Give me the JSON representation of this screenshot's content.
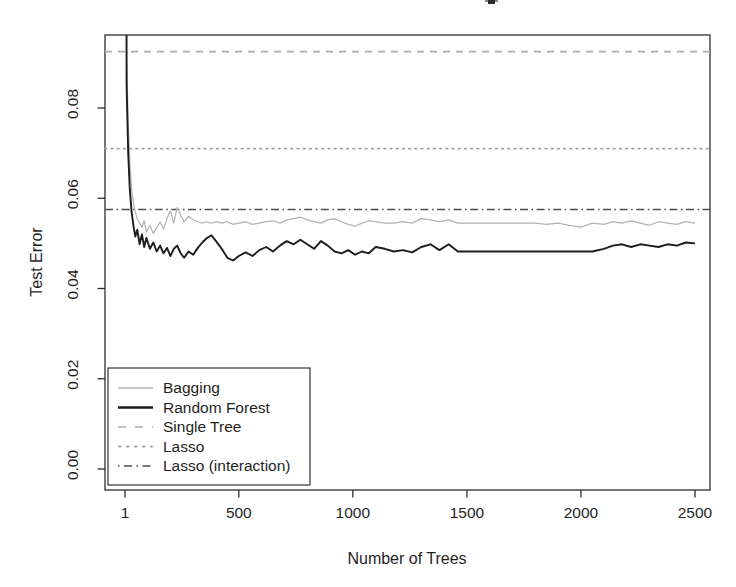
{
  "figure": {
    "background_color": "#ffffff",
    "note": "title cropped off at top edge; only a partial glyph remnant visible"
  },
  "chart_data": {
    "type": "line",
    "title": "",
    "xlabel": "Number of Trees",
    "ylabel": "Test Error",
    "xlim": [
      -87,
      2566
    ],
    "ylim": [
      -0.0046,
      0.0962
    ],
    "grid": false,
    "legend_position": "bottom-left",
    "x_ticks": [
      {
        "value": 1,
        "label": "1"
      },
      {
        "value": 500,
        "label": "500"
      },
      {
        "value": 1000,
        "label": "1000"
      },
      {
        "value": 1500,
        "label": "1500"
      },
      {
        "value": 2000,
        "label": "2000"
      },
      {
        "value": 2500,
        "label": "2500"
      }
    ],
    "y_ticks": [
      {
        "value": 0.0,
        "label": "0.00"
      },
      {
        "value": 0.02,
        "label": "0.02"
      },
      {
        "value": 0.04,
        "label": "0.04"
      },
      {
        "value": 0.06,
        "label": "0.06"
      },
      {
        "value": 0.08,
        "label": "0.08"
      }
    ],
    "x": [
      1,
      8,
      15,
      22,
      30,
      38,
      46,
      55,
      65,
      75,
      85,
      95,
      110,
      125,
      140,
      155,
      170,
      185,
      200,
      215,
      230,
      245,
      260,
      280,
      300,
      320,
      340,
      360,
      380,
      400,
      425,
      450,
      475,
      500,
      530,
      560,
      590,
      620,
      650,
      680,
      710,
      740,
      770,
      800,
      830,
      860,
      890,
      920,
      950,
      980,
      1010,
      1040,
      1070,
      1100,
      1140,
      1180,
      1220,
      1260,
      1300,
      1340,
      1380,
      1420,
      1460,
      1500,
      1550,
      1600,
      1650,
      1700,
      1750,
      1800,
      1850,
      1900,
      1950,
      2000,
      2050,
      2100,
      2140,
      2180,
      2220,
      2260,
      2300,
      2340,
      2380,
      2420,
      2460,
      2500
    ],
    "series": [
      {
        "name": "Bagging",
        "style": "solid-thin",
        "color": "#b2b2b2",
        "values": [
          0.3,
          0.092,
          0.077,
          0.068,
          0.062,
          0.059,
          0.057,
          0.0555,
          0.0545,
          0.0535,
          0.055,
          0.0525,
          0.054,
          0.0522,
          0.0535,
          0.0548,
          0.0532,
          0.0555,
          0.0572,
          0.0545,
          0.058,
          0.0562,
          0.0548,
          0.056,
          0.0552,
          0.0548,
          0.0545,
          0.0548,
          0.0545,
          0.0548,
          0.0545,
          0.0548,
          0.0542,
          0.0545,
          0.0548,
          0.0542,
          0.0545,
          0.0548,
          0.055,
          0.0545,
          0.0552,
          0.0555,
          0.0558,
          0.0552,
          0.0548,
          0.0545,
          0.0552,
          0.0555,
          0.0548,
          0.0542,
          0.0538,
          0.0545,
          0.055,
          0.0548,
          0.0545,
          0.0545,
          0.0548,
          0.0545,
          0.0555,
          0.0552,
          0.0548,
          0.0552,
          0.0545,
          0.0545,
          0.0545,
          0.0545,
          0.0545,
          0.0545,
          0.0545,
          0.0545,
          0.0542,
          0.0545,
          0.054,
          0.0536,
          0.0545,
          0.0542,
          0.0548,
          0.0545,
          0.055,
          0.0545,
          0.054,
          0.0548,
          0.0545,
          0.0542,
          0.0548,
          0.0545
        ]
      },
      {
        "name": "Random Forest",
        "style": "solid-thick",
        "color": "#1c1c1c",
        "values": [
          0.3,
          0.085,
          0.07,
          0.062,
          0.057,
          0.054,
          0.0515,
          0.053,
          0.0498,
          0.052,
          0.0492,
          0.0512,
          0.0488,
          0.0502,
          0.0482,
          0.0495,
          0.0478,
          0.049,
          0.0472,
          0.0488,
          0.0495,
          0.0478,
          0.0468,
          0.0482,
          0.0475,
          0.049,
          0.0502,
          0.0512,
          0.0518,
          0.0505,
          0.0488,
          0.0468,
          0.0462,
          0.0472,
          0.048,
          0.0472,
          0.0485,
          0.0492,
          0.0482,
          0.0495,
          0.0505,
          0.0498,
          0.0508,
          0.0498,
          0.0488,
          0.0505,
          0.0495,
          0.0482,
          0.0478,
          0.0485,
          0.0475,
          0.0482,
          0.0478,
          0.0492,
          0.0488,
          0.0482,
          0.0485,
          0.048,
          0.0492,
          0.0498,
          0.0485,
          0.0498,
          0.0482,
          0.0482,
          0.0482,
          0.0482,
          0.0482,
          0.0482,
          0.0482,
          0.0482,
          0.0482,
          0.0482,
          0.0482,
          0.0482,
          0.0482,
          0.0488,
          0.0495,
          0.0498,
          0.0492,
          0.0498,
          0.0495,
          0.0492,
          0.0498,
          0.0495,
          0.0502,
          0.05
        ]
      }
    ],
    "reference_lines": [
      {
        "name": "Single Tree",
        "value": 0.0925,
        "style": "dashed",
        "color": "#adadad"
      },
      {
        "name": "Lasso",
        "value": 0.071,
        "style": "dotted",
        "color": "#a0a0a0"
      },
      {
        "name": "Lasso (interaction)",
        "value": 0.0575,
        "style": "dashdot",
        "color": "#4d4d4d"
      }
    ],
    "legend": {
      "items": [
        {
          "label": "Bagging",
          "style": "solid-thin",
          "color": "#b2b2b2"
        },
        {
          "label": "Random Forest",
          "style": "solid-thick",
          "color": "#1c1c1c"
        },
        {
          "label": "Single Tree",
          "style": "dashed",
          "color": "#adadad"
        },
        {
          "label": "Lasso",
          "style": "dotted",
          "color": "#a0a0a0"
        },
        {
          "label": "Lasso (interaction)",
          "style": "dashdot",
          "color": "#4d4d4d"
        }
      ]
    }
  }
}
